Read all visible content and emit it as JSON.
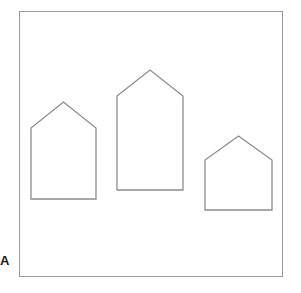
{
  "figure": {
    "panel_label": "A",
    "background_color": "#ffffff",
    "frame": {
      "name": "outer-frame",
      "x": 19,
      "y": 11,
      "width": 264,
      "height": 266,
      "stroke_color": "#9a9a9a",
      "stroke_width": 1,
      "fill": "#ffffff"
    },
    "shapes": [
      {
        "id": "house-left",
        "label": "house-left",
        "kind": "pentagon-house",
        "stroke_color": "#8c8c8c",
        "stroke_width": 1.3,
        "fill": "none",
        "left": 31,
        "right": 96,
        "base_y": 199,
        "eave_y": 128,
        "apex_x": 63.5,
        "apex_y": 102,
        "width": 65,
        "height": 97,
        "roof_height": 26,
        "wall_height": 71,
        "points": "31,199 31,128 63.5,102 96,128 96,199"
      },
      {
        "id": "house-middle",
        "label": "house-middle",
        "kind": "pentagon-house",
        "stroke_color": "#8c8c8c",
        "stroke_width": 1.3,
        "fill": "none",
        "left": 117,
        "right": 183,
        "base_y": 190,
        "eave_y": 96,
        "apex_x": 150,
        "apex_y": 70,
        "width": 66,
        "height": 120,
        "roof_height": 26,
        "wall_height": 94,
        "points": "117,190 117,96 150,70 183,96 183,190"
      },
      {
        "id": "house-right",
        "label": "house-right",
        "kind": "pentagon-house",
        "stroke_color": "#8c8c8c",
        "stroke_width": 1.3,
        "fill": "none",
        "left": 205,
        "right": 272,
        "base_y": 210,
        "eave_y": 160,
        "apex_x": 238.5,
        "apex_y": 136,
        "width": 67,
        "height": 74,
        "roof_height": 24,
        "wall_height": 50,
        "points": "205,210 205,160 238.5,136 272,160 272,210"
      }
    ]
  }
}
